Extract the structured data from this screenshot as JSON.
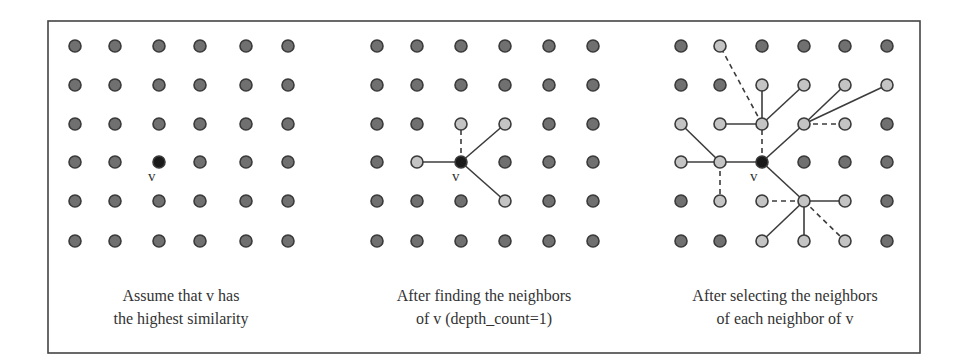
{
  "figure": {
    "frame": {
      "x": 48,
      "y": 21,
      "width": 872,
      "height": 332
    },
    "colors": {
      "background": "#ffffff",
      "frame": "#444444",
      "node_default": "#707070",
      "node_highlight": "#c4c4c4",
      "node_v": "#1a1a1a",
      "node_stroke": "#3a3a3a",
      "edge": "#3c3c3c",
      "text": "#333333"
    },
    "node_radius": 6,
    "rows_y": [
      46,
      85,
      124,
      162,
      201,
      241
    ],
    "panels": [
      {
        "id": "panel-1",
        "columns_x": [
          75,
          115,
          159,
          200,
          246,
          288
        ],
        "v_node": [
          2,
          3
        ],
        "v_label": {
          "text": "v",
          "x": 148,
          "y": 181
        },
        "highlighted": [],
        "edges": [],
        "caption": [
          "Assume that v has",
          "the highest similarity"
        ],
        "caption_x": 181
      },
      {
        "id": "panel-2",
        "columns_x": [
          377,
          417,
          461,
          505,
          549,
          593
        ],
        "v_node": [
          2,
          3
        ],
        "v_label": {
          "text": "v",
          "x": 452,
          "y": 181
        },
        "highlighted": [
          [
            2,
            2
          ],
          [
            3,
            2
          ],
          [
            1,
            3
          ],
          [
            3,
            4
          ]
        ],
        "edges": [
          {
            "from": [
              2,
              3
            ],
            "to": [
              2,
              2
            ],
            "style": "dashed"
          },
          {
            "from": [
              2,
              3
            ],
            "to": [
              3,
              2
            ],
            "style": "solid"
          },
          {
            "from": [
              2,
              3
            ],
            "to": [
              1,
              3
            ],
            "style": "solid"
          },
          {
            "from": [
              2,
              3
            ],
            "to": [
              3,
              4
            ],
            "style": "solid"
          }
        ],
        "caption": [
          "After finding the neighbors",
          "of v (depth_count=1)"
        ],
        "caption_x": 484
      },
      {
        "id": "panel-3",
        "columns_x": [
          681,
          720,
          762,
          804,
          845,
          887
        ],
        "v_node": [
          2,
          3
        ],
        "v_label": {
          "text": "v",
          "x": 750,
          "y": 181
        },
        "highlighted": [
          [
            1,
            0
          ],
          [
            2,
            1
          ],
          [
            3,
            1
          ],
          [
            4,
            1
          ],
          [
            5,
            1
          ],
          [
            0,
            2
          ],
          [
            1,
            2
          ],
          [
            2,
            2
          ],
          [
            3,
            2
          ],
          [
            4,
            2
          ],
          [
            0,
            3
          ],
          [
            1,
            3
          ],
          [
            1,
            4
          ],
          [
            2,
            4
          ],
          [
            3,
            4
          ],
          [
            4,
            4
          ],
          [
            2,
            5
          ],
          [
            3,
            5
          ],
          [
            4,
            5
          ]
        ],
        "edges": [
          {
            "from": [
              2,
              3
            ],
            "to": [
              2,
              2
            ],
            "style": "dashed"
          },
          {
            "from": [
              2,
              3
            ],
            "to": [
              3,
              2
            ],
            "style": "solid"
          },
          {
            "from": [
              2,
              3
            ],
            "to": [
              1,
              3
            ],
            "style": "solid"
          },
          {
            "from": [
              2,
              3
            ],
            "to": [
              3,
              4
            ],
            "style": "solid"
          },
          {
            "from": [
              2,
              2
            ],
            "to": [
              1,
              0
            ],
            "style": "dashed"
          },
          {
            "from": [
              2,
              2
            ],
            "to": [
              2,
              1
            ],
            "style": "solid"
          },
          {
            "from": [
              2,
              2
            ],
            "to": [
              3,
              1
            ],
            "style": "solid"
          },
          {
            "from": [
              2,
              2
            ],
            "to": [
              1,
              2
            ],
            "style": "solid"
          },
          {
            "from": [
              3,
              2
            ],
            "to": [
              4,
              1
            ],
            "style": "solid"
          },
          {
            "from": [
              3,
              2
            ],
            "to": [
              5,
              1
            ],
            "style": "solid"
          },
          {
            "from": [
              3,
              2
            ],
            "to": [
              4,
              2
            ],
            "style": "dashed"
          },
          {
            "from": [
              1,
              3
            ],
            "to": [
              0,
              2
            ],
            "style": "solid"
          },
          {
            "from": [
              1,
              3
            ],
            "to": [
              0,
              3
            ],
            "style": "solid"
          },
          {
            "from": [
              1,
              3
            ],
            "to": [
              1,
              4
            ],
            "style": "dashed"
          },
          {
            "from": [
              3,
              4
            ],
            "to": [
              2,
              4
            ],
            "style": "dashed"
          },
          {
            "from": [
              3,
              4
            ],
            "to": [
              4,
              4
            ],
            "style": "solid"
          },
          {
            "from": [
              3,
              4
            ],
            "to": [
              2,
              5
            ],
            "style": "solid"
          },
          {
            "from": [
              3,
              4
            ],
            "to": [
              3,
              5
            ],
            "style": "solid"
          },
          {
            "from": [
              3,
              4
            ],
            "to": [
              4,
              5
            ],
            "style": "dashed"
          }
        ],
        "caption": [
          "After selecting the neighbors",
          "of each neighbor of v"
        ],
        "caption_x": 785
      }
    ],
    "caption_rows_y": [
      301,
      324
    ]
  }
}
